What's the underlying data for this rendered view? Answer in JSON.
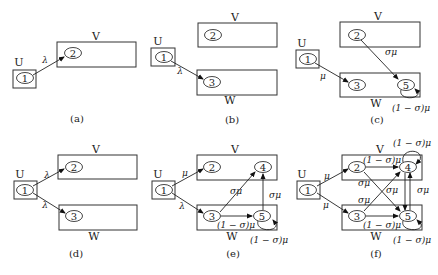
{
  "figure": {
    "panels": [
      {
        "id": "a",
        "caption": "(a)",
        "groups": {
          "U": "U",
          "V": "V"
        },
        "nodes": {
          "n1": "1",
          "n2": "2"
        },
        "edges": [
          {
            "from": "1",
            "to": "2",
            "label": "λ"
          }
        ]
      },
      {
        "id": "b",
        "caption": "(b)",
        "groups": {
          "U": "U",
          "V": "V",
          "W": "W"
        },
        "nodes": {
          "n1": "1",
          "n2": "2",
          "n3": "3"
        },
        "edges": [
          {
            "from": "1",
            "to": "3",
            "label": "λ"
          }
        ]
      },
      {
        "id": "c",
        "caption": "(c)",
        "groups": {
          "U": "U",
          "V": "V",
          "W": "W"
        },
        "nodes": {
          "n1": "1",
          "n2": "2",
          "n3": "3",
          "n5": "5"
        },
        "edges": [
          {
            "from": "1",
            "to": "3",
            "label": "μ"
          },
          {
            "from": "2",
            "to": "5",
            "label": "σμ"
          },
          {
            "from": "5",
            "to": "5",
            "label": "(1 − σ)μ"
          }
        ]
      },
      {
        "id": "d",
        "caption": "(d)",
        "groups": {
          "U": "U",
          "V": "V",
          "W": "W"
        },
        "nodes": {
          "n1": "1",
          "n2": "2",
          "n3": "3"
        },
        "edges": [
          {
            "from": "1",
            "to": "2",
            "label": "λ"
          },
          {
            "from": "1",
            "to": "3",
            "label": "λ"
          }
        ]
      },
      {
        "id": "e",
        "caption": "(e)",
        "groups": {
          "U": "U",
          "V": "V",
          "W": "W"
        },
        "nodes": {
          "n1": "1",
          "n2": "2",
          "n3": "3",
          "n4": "4",
          "n5": "5"
        },
        "edges": [
          {
            "from": "1",
            "to": "2",
            "label": "μ"
          },
          {
            "from": "1",
            "to": "3",
            "label": "λ"
          },
          {
            "from": "3",
            "to": "4",
            "label": "σμ"
          },
          {
            "from": "3",
            "to": "5",
            "label": "(1 − σ)μ"
          },
          {
            "from": "5",
            "to": "4",
            "label": "σμ"
          },
          {
            "from": "5",
            "to": "5",
            "label": "(1 − σ)μ"
          }
        ]
      },
      {
        "id": "f",
        "caption": "(f)",
        "groups": {
          "U": "U",
          "V": "V",
          "W": "W"
        },
        "nodes": {
          "n1": "1",
          "n2": "2",
          "n3": "3",
          "n4": "4",
          "n5": "5"
        },
        "edges": [
          {
            "from": "1",
            "to": "2",
            "label": "μ"
          },
          {
            "from": "1",
            "to": "3",
            "label": "μ"
          },
          {
            "from": "2",
            "to": "4",
            "label": "(1 − σ)μ"
          },
          {
            "from": "2",
            "to": "5",
            "label": "σμ"
          },
          {
            "from": "3",
            "to": "4",
            "label": "σμ"
          },
          {
            "from": "3",
            "to": "5",
            "label": "(1 − σ)μ"
          },
          {
            "from": "4",
            "to": "5",
            "label": "σμ"
          },
          {
            "from": "5",
            "to": "4",
            "label": "σμ"
          },
          {
            "from": "4",
            "to": "4",
            "label": "(1 − σ)μ"
          },
          {
            "from": "5",
            "to": "5",
            "label": "(1 − σ)μ"
          }
        ]
      }
    ]
  }
}
